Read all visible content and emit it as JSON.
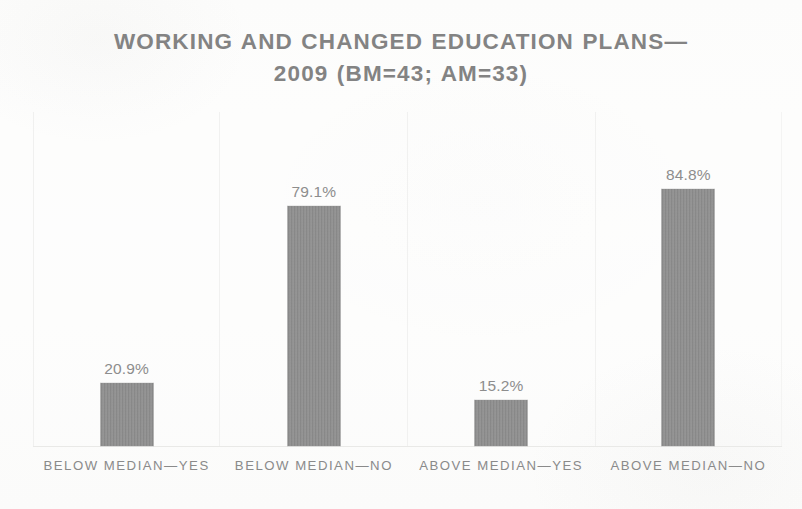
{
  "chart_data": {
    "type": "bar",
    "title_lines": [
      "WORKING AND CHANGED EDUCATION PLANS—",
      "2009 (BM=43; AM=33)"
    ],
    "categories": [
      "BELOW MEDIAN—YES",
      "BELOW MEDIAN—NO",
      "ABOVE MEDIAN—YES",
      "ABOVE MEDIAN—NO"
    ],
    "values": [
      20.9,
      79.1,
      15.2,
      84.8
    ],
    "value_labels": [
      "20.9%",
      "79.1%",
      "15.2%",
      "84.8%"
    ],
    "xlabel": "",
    "ylabel": "",
    "ylim": [
      0,
      100
    ],
    "grid": false,
    "legend": false,
    "bar_color": "#8e8e8e",
    "text_color": "#8a8a8a",
    "background_color": "#fdfdfc"
  },
  "chart": {
    "title_line_1": "WORKING AND CHANGED EDUCATION PLANS—",
    "title_line_2": "2009 (BM=43; AM=33)",
    "bars": [
      {
        "label": "BELOW MEDIAN—YES",
        "value_label": "20.9%"
      },
      {
        "label": "BELOW MEDIAN—NO",
        "value_label": "79.1%"
      },
      {
        "label": "ABOVE MEDIAN—YES",
        "value_label": "15.2%"
      },
      {
        "label": "ABOVE MEDIAN—NO",
        "value_label": "84.8%"
      }
    ]
  }
}
